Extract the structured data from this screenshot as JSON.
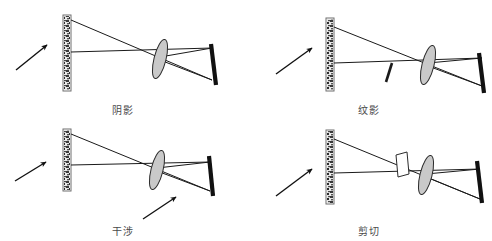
{
  "figure": {
    "background_color": "#ffffff",
    "panel_count": 4
  },
  "style": {
    "ray_color": "#1a1a1a",
    "screen_color": "#111111",
    "lens_fill": "#c9c9c9",
    "lens_stroke": "#2b2b2b",
    "object_speckle_color": "#3a3a3a",
    "caption_color": "#4a4a4a",
    "arrow_color": "#111111"
  },
  "panels": [
    {
      "id": "shadow",
      "caption": "阴影",
      "caption_meaning": "shadowgraph",
      "elements": {
        "source_arrow": "incoming-light-arrow",
        "object": "speckled-object-bar",
        "lens": "tilted-convex-lens",
        "screen": "slanted-screen",
        "extra": "none"
      }
    },
    {
      "id": "schlieren",
      "caption": "纹影",
      "caption_meaning": "schlieren",
      "elements": {
        "source_arrow": "incoming-light-arrow",
        "object": "speckled-object-bar",
        "lens": "tilted-convex-lens",
        "screen": "slanted-screen",
        "extra": "knife-edge"
      }
    },
    {
      "id": "interference",
      "caption": "干涉",
      "caption_meaning": "interference",
      "elements": {
        "source_arrow": "incoming-light-arrow",
        "object": "speckled-object-bar",
        "lens": "tilted-convex-lens",
        "screen": "slanted-screen",
        "extra": "pointer-arrow"
      }
    },
    {
      "id": "shearing",
      "caption": "剪切",
      "caption_meaning": "shearing",
      "elements": {
        "source_arrow": "incoming-light-arrow",
        "object": "speckled-object-bar",
        "lens": "tilted-convex-lens",
        "screen": "slanted-screen",
        "extra": "shearing-prism"
      }
    }
  ]
}
